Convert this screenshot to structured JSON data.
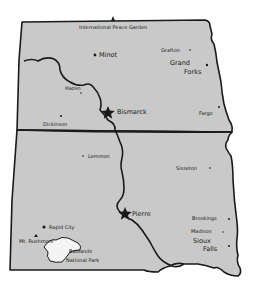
{
  "map": {
    "colors": {
      "land": "#c9c9c9",
      "outline": "#1a1a1a",
      "park": "#f4f4f4",
      "background": "#ffffff"
    },
    "states": [
      {
        "name": "North Dakota"
      },
      {
        "name": "South Dakota"
      }
    ],
    "features": {
      "river": "Missouri River",
      "park": {
        "label_line1": "Badlands",
        "label_line2": "National Park"
      }
    },
    "places": {
      "peace_garden": {
        "label": "International Peace Garden",
        "marker": "landmark-icon"
      },
      "minot": {
        "label": "Minot",
        "marker": "city-dot"
      },
      "grafton": {
        "label": "Grafton",
        "marker": "city-dot"
      },
      "grand_forks": {
        "label_line1": "Grand",
        "label_line2": "Forks",
        "marker": "city-dot"
      },
      "hazen": {
        "label": "Hazen",
        "marker": "city-dot"
      },
      "bismarck": {
        "label": "Bismarck",
        "marker": "capital-star"
      },
      "dickinson": {
        "label": "Dickinson",
        "marker": "city-dot"
      },
      "fargo": {
        "label": "Fargo",
        "marker": "city-dot"
      },
      "lemmon": {
        "label": "Lemmon",
        "marker": "city-dot"
      },
      "sisseton": {
        "label": "Sisseton",
        "marker": "city-dot"
      },
      "pierre": {
        "label": "Pierre",
        "marker": "capital-star"
      },
      "rapid_city": {
        "label": "Rapid City",
        "marker": "city-dot"
      },
      "mt_rushmore": {
        "label": "Mt. Rushmore",
        "marker": "landmark-icon"
      },
      "brookings": {
        "label": "Brookings",
        "marker": "city-dot"
      },
      "madison": {
        "label": "Madison",
        "marker": "city-dot"
      },
      "sioux_falls": {
        "label_line1": "Sioux",
        "label_line2": "Falls",
        "marker": "city-dot"
      }
    }
  }
}
